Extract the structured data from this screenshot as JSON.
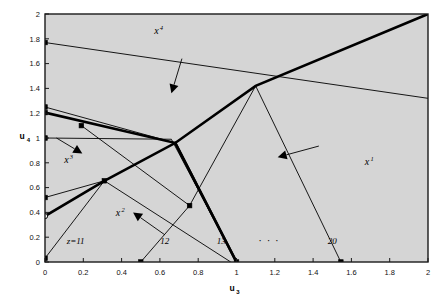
{
  "figure": {
    "background": "#ffffff",
    "plot_fill": "#d5d5d5",
    "frame_color": "#1a1a1a",
    "line_color": "#000000"
  },
  "chart_data": {
    "type": "line",
    "title": "",
    "xlabel": "u3",
    "ylabel": "u4",
    "xlim": [
      0,
      2
    ],
    "ylim": [
      0,
      2
    ],
    "grid": false,
    "legend": "none",
    "xticks": [
      0,
      0.2,
      0.4,
      0.6,
      0.8,
      1,
      1.2,
      1.4,
      1.6,
      1.8,
      2
    ],
    "xticklabels": [
      "0",
      "0.2",
      "0.4",
      "0.6",
      "0.8",
      "1",
      "1.2",
      "1.4",
      "1.6",
      "1.8",
      "2"
    ],
    "yticks": [
      0,
      0.2,
      0.4,
      0.6,
      0.8,
      1,
      1.2,
      1.4,
      1.6,
      1.8,
      2
    ],
    "yticklabels": [
      "0",
      "0.2",
      "0.4",
      "0.6",
      "0.8",
      "1",
      "1.2",
      "1.4",
      "1.6",
      "1.8",
      "2"
    ],
    "series": [
      {
        "name": "thick-upper-envelope",
        "weight": "thick",
        "points": [
          [
            0,
            1.205
          ],
          [
            0.68,
            0.96
          ],
          [
            1.1,
            1.42
          ],
          [
            2.0,
            2.0
          ]
        ]
      },
      {
        "name": "thick-lower-left-ray",
        "weight": "thick",
        "points": [
          [
            0,
            0.37
          ],
          [
            0.31,
            0.655
          ],
          [
            0.68,
            0.96
          ],
          [
            1.0,
            0.0
          ]
        ]
      },
      {
        "name": "thick-ridge-to-axis",
        "weight": "thick",
        "points": [
          [
            0.68,
            0.96
          ],
          [
            1.0,
            0.0
          ]
        ]
      },
      {
        "name": "boundary-z11",
        "weight": "thin",
        "points": [
          [
            0,
            0.03
          ],
          [
            0.31,
            0.655
          ]
        ]
      },
      {
        "name": "boundary-x4-top",
        "weight": "thin",
        "points": [
          [
            0,
            1.77
          ],
          [
            2.0,
            1.32
          ]
        ]
      },
      {
        "name": "boundary-12a",
        "weight": "thin",
        "points": [
          [
            0,
            1.25
          ],
          [
            0.68,
            0.96
          ]
        ]
      },
      {
        "name": "boundary-12b",
        "weight": "thin",
        "points": [
          [
            0,
            1.0
          ],
          [
            0.66,
            0.99
          ]
        ]
      },
      {
        "name": "boundary-13a",
        "weight": "thin",
        "points": [
          [
            0,
            0.52
          ],
          [
            0.31,
            0.655
          ]
        ]
      },
      {
        "name": "boundary-13b",
        "weight": "thin",
        "points": [
          [
            0.19,
            1.1
          ],
          [
            0.755,
            0.455
          ]
        ]
      },
      {
        "name": "boundary-fan-1",
        "weight": "thin",
        "points": [
          [
            0.31,
            0.655
          ],
          [
            0.97,
            0.0
          ]
        ]
      },
      {
        "name": "boundary-fan-2",
        "weight": "thin",
        "points": [
          [
            0.5,
            0.0
          ],
          [
            0.755,
            0.455
          ]
        ]
      },
      {
        "name": "boundary-fan-3",
        "weight": "thin",
        "points": [
          [
            0.66,
            0.99
          ],
          [
            1.0,
            0.0
          ]
        ]
      },
      {
        "name": "boundary-20",
        "weight": "thin",
        "points": [
          [
            1.1,
            1.42
          ],
          [
            1.545,
            0.0
          ]
        ]
      },
      {
        "name": "boundary-center-down",
        "weight": "thin",
        "points": [
          [
            1.1,
            1.42
          ],
          [
            0.755,
            0.455
          ]
        ]
      }
    ],
    "markers_filled": [
      [
        0,
        0.03
      ],
      [
        0,
        0.52
      ],
      [
        0,
        1.0
      ],
      [
        0,
        1.205
      ],
      [
        0,
        1.25
      ],
      [
        0,
        1.77
      ],
      [
        0.19,
        1.1
      ],
      [
        0.31,
        0.655
      ],
      [
        0.5,
        0.0
      ],
      [
        0.755,
        0.455
      ],
      [
        1.0,
        0.0
      ],
      [
        1.545,
        0.0
      ]
    ],
    "markers_open": [
      [
        0,
        0.37
      ]
    ],
    "annotations": [
      {
        "name": "region-x4",
        "text": "x",
        "sup": "4",
        "x": 0.57,
        "y": 1.84
      },
      {
        "name": "region-x3",
        "text": "x",
        "sup": "3",
        "x": 0.1,
        "y": 0.8
      },
      {
        "name": "region-x2",
        "text": "x",
        "sup": "2",
        "x": 0.37,
        "y": 0.37
      },
      {
        "name": "region-x1",
        "text": "x",
        "sup": "1",
        "x": 1.67,
        "y": 0.78
      },
      {
        "name": "label-z11",
        "text": "z=11",
        "x": 0.16,
        "y": 0.145
      },
      {
        "name": "label-12",
        "text": "12",
        "x": 0.625,
        "y": 0.145
      },
      {
        "name": "label-13",
        "text": "13",
        "x": 0.92,
        "y": 0.145
      },
      {
        "name": "label-dots",
        "text": "· · ·",
        "x": 1.17,
        "y": 0.145
      },
      {
        "name": "label-20",
        "text": "20",
        "x": 1.5,
        "y": 0.145
      }
    ],
    "arrows": [
      {
        "name": "arrow-to-x4-boundary",
        "from": [
          0.715,
          1.64
        ],
        "to": [
          0.66,
          1.36
        ]
      },
      {
        "name": "arrow-to-x3-boundary",
        "from": [
          0.06,
          1.0
        ],
        "to": [
          0.195,
          0.875
        ]
      },
      {
        "name": "arrow-to-12-boundary",
        "from": [
          0.625,
          0.22
        ],
        "to": [
          0.46,
          0.4
        ]
      },
      {
        "name": "arrow-to-20-boundary",
        "from": [
          1.43,
          0.935
        ],
        "to": [
          1.215,
          0.845
        ]
      }
    ]
  }
}
